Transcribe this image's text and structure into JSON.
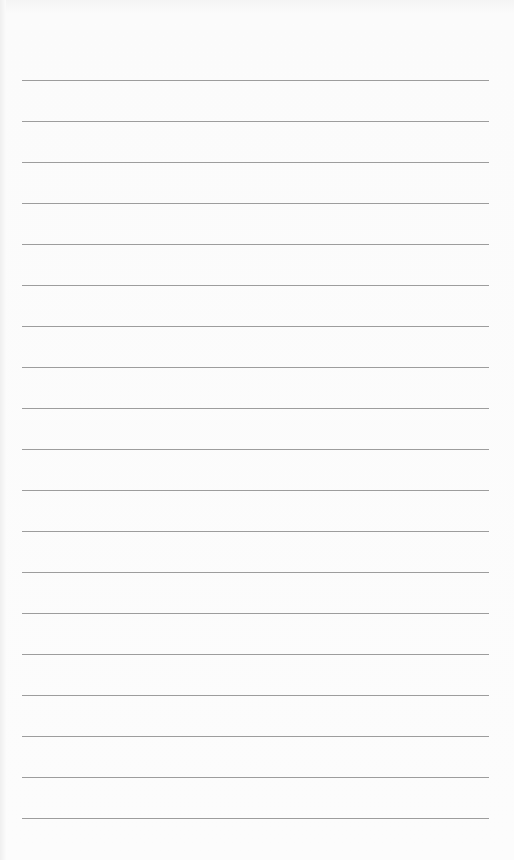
{
  "page": {
    "type": "lined-paper",
    "background_color": "#fbfbfb",
    "rule_color": "#9d9d9d",
    "rule_left": 22,
    "rule_width": 467,
    "first_rule_y": 80,
    "rule_spacing": 41,
    "rule_count": 19
  }
}
